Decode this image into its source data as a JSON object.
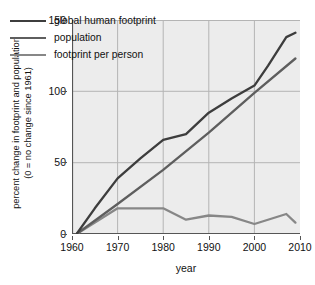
{
  "chart_data": {
    "type": "line",
    "title": "",
    "xlabel": "year",
    "ylabel": "percent change in footprint and population (0 = no change since 1961)",
    "ylabel_line1": "percent change in footprint and population",
    "ylabel_line2": "(0 = no change since 1961)",
    "xlim": [
      1960,
      2010
    ],
    "ylim": [
      0,
      150
    ],
    "grid": true,
    "legend_position": "upper-left-inside",
    "xticks": [
      1960,
      1970,
      1980,
      1990,
      2000,
      2010
    ],
    "xtick_labels": [
      "1960",
      "1970",
      "1980",
      "1990",
      "2000",
      "2010"
    ],
    "yticks": [
      0,
      50,
      100,
      150
    ],
    "ytick_labels": [
      "0",
      "50",
      "100",
      "150"
    ],
    "series": [
      {
        "name": "global human footprint",
        "color": "#3d3d3d",
        "x": [
          1961,
          1965,
          1970,
          1975,
          1980,
          1985,
          1990,
          1995,
          2000,
          2003,
          2007,
          2009
        ],
        "values": [
          0,
          18,
          39,
          53,
          66,
          70,
          85,
          95,
          104,
          118,
          138,
          141
        ]
      },
      {
        "name": "population",
        "color": "#5e5e5e",
        "x": [
          1961,
          1970,
          1980,
          1990,
          2000,
          2009
        ],
        "values": [
          0,
          21,
          45,
          71,
          99,
          123
        ]
      },
      {
        "name": "footprint per person",
        "color": "#878787",
        "x": [
          1961,
          1970,
          1980,
          1985,
          1990,
          1995,
          2000,
          2007,
          2009
        ],
        "values": [
          0,
          18,
          18,
          10,
          13,
          12,
          7,
          14,
          8
        ]
      }
    ]
  },
  "legend": {
    "items": [
      {
        "label": "global human footprint",
        "color": "#3d3d3d"
      },
      {
        "label": "population",
        "color": "#5e5e5e"
      },
      {
        "label": "footprint per person",
        "color": "#878787"
      }
    ]
  },
  "axes": {
    "x_title": "year",
    "y_title_line1": "percent change in footprint and population",
    "y_title_line2": "(0 = no change since 1961)"
  },
  "colors": {
    "plot_background": "#ececec",
    "page_background": "#ffffff",
    "gridline": "#b4b4b4",
    "axis": "#555555",
    "text": "#111111"
  }
}
